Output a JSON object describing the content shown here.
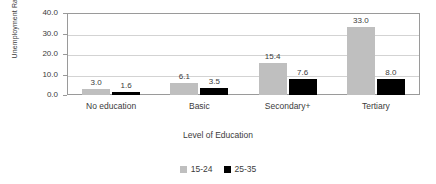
{
  "chart_data": {
    "type": "bar",
    "title": "",
    "xlabel": "Level of Education",
    "ylabel": "Unemployment Rate (%)",
    "categories": [
      "No education",
      "Basic",
      "Secondary+",
      "Tertiary"
    ],
    "series": [
      {
        "name": "15-24",
        "color": "#bfbfbf",
        "values": [
          3.0,
          6.1,
          15.4,
          33.0
        ]
      },
      {
        "name": "25-35",
        "color": "#000000",
        "values": [
          1.6,
          3.5,
          7.6,
          8.0
        ]
      }
    ],
    "value_labels": [
      [
        "3.0",
        "1.6"
      ],
      [
        "6.1",
        "3.5"
      ],
      [
        "15.4",
        "7.6"
      ],
      [
        "33.0",
        "8.0"
      ]
    ],
    "ylim": [
      0,
      40
    ],
    "yticks": [
      40.0,
      30.0,
      20.0,
      10.0,
      0.0
    ],
    "ytick_labels": [
      "40.0",
      "30.0",
      "20.0",
      "10.0",
      "0.0"
    ],
    "grid": true,
    "grid_axis": "y",
    "legend_position": "bottom",
    "legend": [
      "15-24",
      "25-35"
    ]
  }
}
